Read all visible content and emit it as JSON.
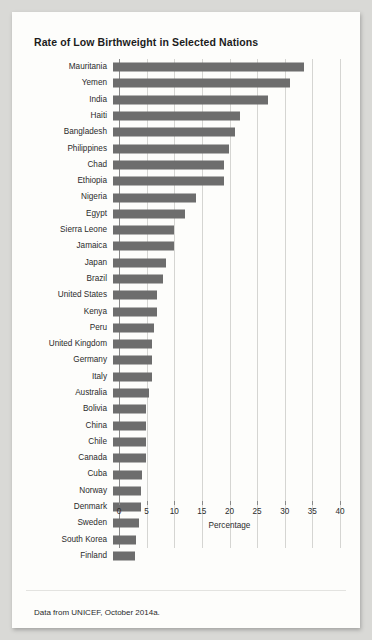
{
  "figure": {
    "title": "Rate of Low Birthweight in Selected Nations",
    "caption": "Data from UNICEF, October 2014a.",
    "bar_color": "#6d6d6d",
    "card_color": "#fdfdfb",
    "page_color": "#d9d9d6"
  },
  "chart_data": {
    "type": "bar",
    "orientation": "horizontal",
    "title": "Rate of Low Birthweight in Selected Nations",
    "xlabel": "Percentage",
    "ylabel": "",
    "xlim": [
      0,
      40
    ],
    "xticks": [
      0,
      5,
      10,
      15,
      20,
      25,
      30,
      35,
      40
    ],
    "grid": true,
    "legend": false,
    "categories": [
      "Mauritania",
      "Yemen",
      "India",
      "Haiti",
      "Bangladesh",
      "Philippines",
      "Chad",
      "Ethiopia",
      "Nigeria",
      "Egypt",
      "Sierra Leone",
      "Jamaica",
      "Japan",
      "Brazil",
      "United States",
      "Kenya",
      "Peru",
      "United Kingdom",
      "Germany",
      "Italy",
      "Australia",
      "Bolivia",
      "China",
      "Chile",
      "Canada",
      "Cuba",
      "Norway",
      "Denmark",
      "Sweden",
      "South Korea",
      "Finland"
    ],
    "values": [
      34.5,
      32.0,
      28.0,
      23.0,
      22.0,
      21.0,
      20.0,
      20.0,
      15.0,
      13.0,
      11.0,
      11.0,
      9.6,
      9.0,
      8.0,
      8.0,
      7.4,
      7.0,
      7.0,
      7.0,
      6.5,
      6.0,
      6.0,
      6.0,
      6.0,
      5.2,
      5.0,
      5.0,
      4.7,
      4.2,
      4.0
    ]
  }
}
